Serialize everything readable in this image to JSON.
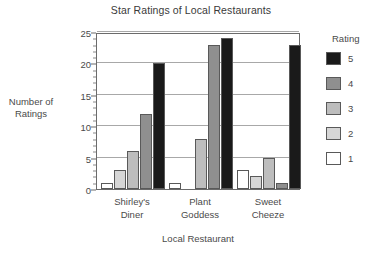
{
  "chart_data": {
    "type": "bar",
    "title": "Star Ratings of Local Restaurants",
    "xlabel": "Local Restaurant",
    "ylabel": "Number of Ratings",
    "ylabel_lines": [
      "Number of",
      "Ratings"
    ],
    "categories": [
      "Shirley's Diner",
      "Plant Goddess",
      "Sweet Cheeze"
    ],
    "category_lines": [
      [
        "Shirley's",
        "Diner"
      ],
      [
        "Plant",
        "Goddess"
      ],
      [
        "Sweet",
        "Cheeze"
      ]
    ],
    "legend_title": "Rating",
    "legend_position": "right",
    "grid": true,
    "ylim": [
      0,
      25
    ],
    "yticks": [
      0,
      5,
      10,
      15,
      20,
      25
    ],
    "ytick_labels": [
      "0",
      "5",
      "10",
      "15",
      "20",
      "25"
    ],
    "series": [
      {
        "name": "1",
        "color": "#ffffff",
        "values": [
          1,
          1,
          3
        ]
      },
      {
        "name": "2",
        "color": "#d6d6d6",
        "values": [
          3,
          0,
          2
        ]
      },
      {
        "name": "3",
        "color": "#bdbdbd",
        "values": [
          6,
          8,
          5
        ]
      },
      {
        "name": "4",
        "color": "#8f8f8f",
        "values": [
          12,
          23,
          1
        ]
      },
      {
        "name": "5",
        "color": "#1a1a1a",
        "values": [
          20,
          24,
          23
        ]
      }
    ],
    "legend_entries": [
      {
        "label": "5",
        "color": "#1a1a1a"
      },
      {
        "label": "4",
        "color": "#8f8f8f"
      },
      {
        "label": "3",
        "color": "#bdbdbd"
      },
      {
        "label": "2",
        "color": "#d6d6d6"
      },
      {
        "label": "1",
        "color": "#ffffff"
      }
    ],
    "colors": {
      "axis": "#6b6b6b",
      "grid": "#a8a8a8",
      "bar_outline": "#595959",
      "text": "#4a4a4a",
      "background": "#ffffff"
    }
  }
}
